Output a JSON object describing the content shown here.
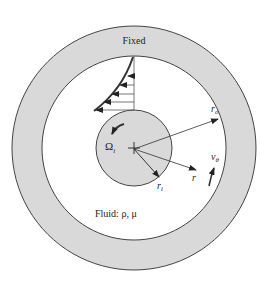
{
  "diagram": {
    "labels": {
      "fixed": "Fixed",
      "omega": "Ω",
      "omega_sub": "i",
      "r_o": "r",
      "r_o_sub": "o",
      "r_i": "r",
      "r_i_sub": "i",
      "r": "r",
      "v_theta": "v",
      "v_theta_sub": "θ",
      "fluid": "Fluid: ρ, μ"
    },
    "colors": {
      "wall_fill": "#d9d9d9",
      "cylinder_fill": "#d9d9d9",
      "stroke": "#333333",
      "background": "#ffffff"
    },
    "geometry": {
      "center": [
        134,
        148
      ],
      "outer_wall_outer_radius": 122,
      "outer_wall_inner_radius": 92,
      "inner_cylinder_radius": 38,
      "velocity_profile_arrows_y": [
        76,
        85,
        94,
        102,
        110
      ]
    }
  }
}
